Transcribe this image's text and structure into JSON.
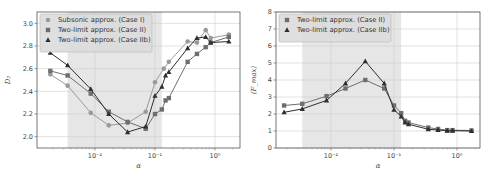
{
  "chart_data": [
    {
      "type": "line",
      "title": "",
      "xlabel": "α",
      "ylabel": "D₂",
      "xscale": "log",
      "xlim": [
        0.0015,
        2.5
      ],
      "ylim": [
        1.9,
        3.1
      ],
      "xticks": [
        0.01,
        0.1,
        1
      ],
      "xtick_labels": [
        "10⁻²",
        "10⁻¹",
        "10⁰"
      ],
      "yticks": [
        2.0,
        2.2,
        2.4,
        2.6,
        2.8,
        3.0
      ],
      "ytick_labels": [
        "2.0",
        "2.2",
        "2.4",
        "2.6",
        "2.8",
        "3.0"
      ],
      "grid": true,
      "legend_position": "upper left",
      "shaded_region": [
        0.0035,
        0.13
      ],
      "series": [
        {
          "name": "Subsonic approx. (Case I)",
          "marker": "circle",
          "color": "#9a9a9a",
          "x": [
            0.0018,
            0.0035,
            0.0085,
            0.017,
            0.035,
            0.07,
            0.1,
            0.14,
            0.17,
            0.35,
            0.5,
            0.7,
            0.85,
            1.7
          ],
          "y": [
            2.55,
            2.45,
            2.21,
            2.1,
            2.12,
            2.22,
            2.48,
            2.6,
            2.66,
            2.84,
            2.83,
            2.94,
            2.87,
            2.9
          ]
        },
        {
          "name": "Two-limit approx. (Case II)",
          "marker": "square",
          "color": "#6e6e6e",
          "x": [
            0.0018,
            0.0035,
            0.0085,
            0.017,
            0.035,
            0.07,
            0.1,
            0.13,
            0.15,
            0.17,
            0.35,
            0.5,
            0.7,
            0.85,
            1.7
          ],
          "y": [
            2.58,
            2.54,
            2.38,
            2.22,
            2.13,
            2.07,
            2.2,
            2.24,
            2.32,
            2.34,
            2.66,
            2.73,
            2.79,
            2.83,
            2.88
          ]
        },
        {
          "name": "Two-limit approx. (Case IIb)",
          "marker": "triangle",
          "color": "#2e2e2e",
          "x": [
            0.0018,
            0.0035,
            0.0085,
            0.017,
            0.035,
            0.07,
            0.1,
            0.13,
            0.15,
            0.17,
            0.35,
            0.5,
            0.7,
            0.85,
            1.7
          ],
          "y": [
            2.74,
            2.63,
            2.42,
            2.2,
            2.04,
            2.09,
            2.36,
            2.44,
            2.54,
            2.57,
            2.78,
            2.87,
            2.88,
            2.83,
            2.84
          ]
        }
      ]
    },
    {
      "type": "line",
      "title": "",
      "xlabel": "α",
      "ylabel": "⟨F_max⟩",
      "xscale": "log",
      "xlim": [
        0.0015,
        2.5
      ],
      "ylim": [
        0,
        8
      ],
      "xticks": [
        0.01,
        0.1,
        1
      ],
      "xtick_labels": [
        "10⁻²",
        "10⁻¹",
        "10⁰"
      ],
      "yticks": [
        0,
        1,
        2,
        3,
        4,
        5,
        6,
        7,
        8
      ],
      "ytick_labels": [
        "0",
        "1",
        "2",
        "3",
        "4",
        "5",
        "6",
        "7",
        "8"
      ],
      "grid": true,
      "legend_position": "upper left",
      "shaded_region": [
        0.0035,
        0.13
      ],
      "series": [
        {
          "name": "Two-limit approx. (Case II)",
          "marker": "square",
          "color": "#6e6e6e",
          "x": [
            0.0018,
            0.0035,
            0.0085,
            0.017,
            0.035,
            0.07,
            0.1,
            0.13,
            0.15,
            0.17,
            0.35,
            0.5,
            0.7,
            0.85,
            1.7
          ],
          "y": [
            2.5,
            2.6,
            3.05,
            3.5,
            4.0,
            3.5,
            2.5,
            2.05,
            1.6,
            1.5,
            1.2,
            1.12,
            1.05,
            1.05,
            1.03
          ]
        },
        {
          "name": "Two-limit approx. (Case IIb)",
          "marker": "triangle",
          "color": "#2e2e2e",
          "x": [
            0.0018,
            0.0035,
            0.0085,
            0.017,
            0.035,
            0.07,
            0.1,
            0.13,
            0.15,
            0.17,
            0.35,
            0.5,
            0.7,
            0.85,
            1.7
          ],
          "y": [
            2.1,
            2.3,
            2.8,
            3.8,
            5.1,
            3.8,
            2.25,
            1.85,
            1.5,
            1.4,
            1.1,
            1.06,
            1.02,
            1.02,
            1.0
          ]
        }
      ]
    }
  ],
  "figure": {
    "left": {
      "legend": [
        "Subsonic approx. (Case I)",
        "Two-limit approx. (Case II)",
        "Two-limit approx. (Case IIb)"
      ],
      "xlabel": "α",
      "ylabel": "D₂"
    },
    "right": {
      "legend": [
        "Two-limit approx. (Case II)",
        "Two-limit approx. (Case IIb)"
      ],
      "xlabel": "α",
      "ylabel": "⟨F_max⟩"
    }
  }
}
